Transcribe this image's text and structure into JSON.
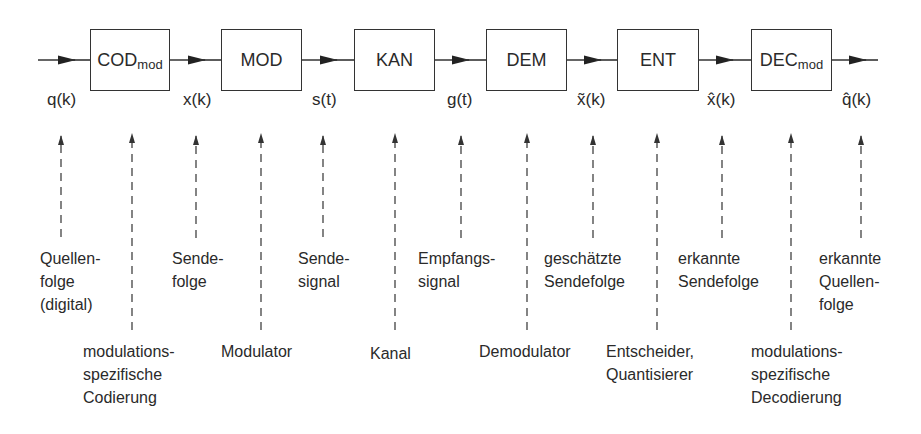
{
  "blocks": [
    {
      "id": "cod",
      "name": "COD",
      "sub": "mod",
      "x": 90,
      "w": 80
    },
    {
      "id": "mod",
      "name": "MOD",
      "sub": "",
      "x": 221,
      "w": 81
    },
    {
      "id": "kan",
      "name": "KAN",
      "sub": "",
      "x": 354,
      "w": 81
    },
    {
      "id": "dem",
      "name": "DEM",
      "sub": "",
      "x": 486,
      "w": 81
    },
    {
      "id": "ent",
      "name": "ENT",
      "sub": "",
      "x": 617,
      "w": 82
    },
    {
      "id": "dec",
      "name": "DEC",
      "sub": "mod",
      "x": 751,
      "w": 81
    }
  ],
  "signals": [
    {
      "id": "q",
      "label": "q(k)",
      "x": 47
    },
    {
      "id": "x",
      "label": "x(k)",
      "x": 183
    },
    {
      "id": "s",
      "label": "s(t)",
      "x": 312
    },
    {
      "id": "g",
      "label": "g(t)",
      "x": 447
    },
    {
      "id": "x-tilde",
      "label": "x̃(k)",
      "x": 577
    },
    {
      "id": "x-hat",
      "label": "x̂(k)",
      "x": 707
    },
    {
      "id": "q-hat",
      "label": "q̂(k)",
      "x": 842
    }
  ],
  "upper_labels": [
    {
      "id": "quellenfolge",
      "text": "Quellen-\nfolge\n(digital)",
      "x": 40
    },
    {
      "id": "sendefolge",
      "text": "Sende-\nfolge",
      "x": 172
    },
    {
      "id": "sendesignal",
      "text": "Sende-\nsignal",
      "x": 298
    },
    {
      "id": "empfangssignal",
      "text": "Empfangs-\nsignal",
      "x": 418
    },
    {
      "id": "geschaetzte-sendefolge",
      "text": "geschätzte\nSendefolge",
      "x": 544
    },
    {
      "id": "erkannte-sendefolge",
      "text": "erkannte\nSendefolge",
      "x": 678
    },
    {
      "id": "erkannte-quellenfolge",
      "text": "erkannte\nQuellen-\nfolge",
      "x": 819
    }
  ],
  "lower_labels": [
    {
      "id": "mod-codierung",
      "text": "modulations-\nspezifische\nCodierung",
      "x": 83
    },
    {
      "id": "modulator",
      "text": "Modulator",
      "x": 221
    },
    {
      "id": "kanal",
      "text": "Kanal",
      "x": 370
    },
    {
      "id": "demodulator",
      "text": "Demodulator",
      "x": 479
    },
    {
      "id": "entscheider",
      "text": "Entscheider,\nQuantisierer",
      "x": 606
    },
    {
      "id": "mod-decodierung",
      "text": "modulations-\nspezifische\nDecodierung",
      "x": 751
    }
  ],
  "colors": {
    "line": "#333333",
    "text": "#2a2a2a",
    "background": "#ffffff"
  }
}
